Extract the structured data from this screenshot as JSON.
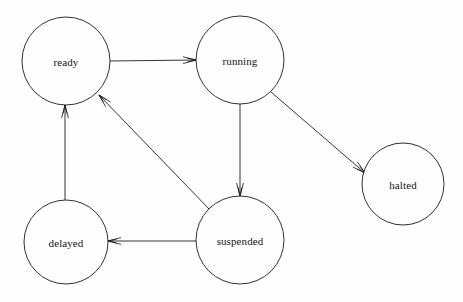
{
  "diagram": {
    "type": "state-diagram",
    "background_color": "#fefefe",
    "stroke_color": "#1d1d1d",
    "text_color": "#161616",
    "width": 463,
    "height": 302,
    "nodes": [
      {
        "id": "ready",
        "label": "ready",
        "cx": 66,
        "cy": 61,
        "r": 44
      },
      {
        "id": "running",
        "label": "running",
        "cx": 240,
        "cy": 60,
        "r": 44
      },
      {
        "id": "halted",
        "label": "halted",
        "cx": 403,
        "cy": 184,
        "r": 41
      },
      {
        "id": "suspended",
        "label": "suspended",
        "cx": 240,
        "cy": 240,
        "r": 44
      },
      {
        "id": "delayed",
        "label": "delayed",
        "cx": 66,
        "cy": 242,
        "r": 42
      }
    ],
    "edges": [
      {
        "id": "ready-to-running",
        "from": "ready",
        "to": "running",
        "x1": 110,
        "y1": 61,
        "x2": 196,
        "y2": 60
      },
      {
        "id": "running-to-suspended",
        "from": "running",
        "to": "suspended",
        "x1": 240,
        "y1": 104,
        "x2": 240,
        "y2": 196
      },
      {
        "id": "running-to-halted",
        "from": "running",
        "to": "halted",
        "x1": 271,
        "y1": 92,
        "x2": 365,
        "y2": 173
      },
      {
        "id": "suspended-to-ready",
        "from": "suspended",
        "to": "ready",
        "x1": 211,
        "y1": 211,
        "x2": 99,
        "y2": 95
      },
      {
        "id": "suspended-to-delayed",
        "from": "suspended",
        "to": "delayed",
        "x1": 196,
        "y1": 241,
        "x2": 108,
        "y2": 241
      },
      {
        "id": "delayed-to-ready",
        "from": "delayed",
        "to": "ready",
        "x1": 65,
        "y1": 200,
        "x2": 65,
        "y2": 105
      }
    ]
  }
}
